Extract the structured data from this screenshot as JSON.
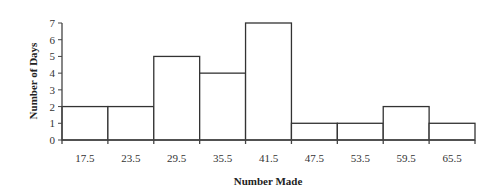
{
  "chart_data": {
    "type": "bar",
    "subtype": "histogram",
    "title": "",
    "xlabel": "Number Made",
    "ylabel": "Number of Days",
    "categories": [
      "17.5",
      "23.5",
      "29.5",
      "35.5",
      "41.5",
      "47.5",
      "53.5",
      "59.5",
      "65.5"
    ],
    "values": [
      2,
      2,
      5,
      4,
      7,
      1,
      1,
      2,
      1
    ],
    "ylim": [
      0,
      7
    ],
    "yticks": [
      "0",
      "1",
      "2",
      "3",
      "4",
      "5",
      "6",
      "7"
    ],
    "grid": false,
    "legend": null,
    "colors": {
      "bar_fill": "#ffffff",
      "bar_stroke": "#333333",
      "axis": "#444444"
    }
  }
}
